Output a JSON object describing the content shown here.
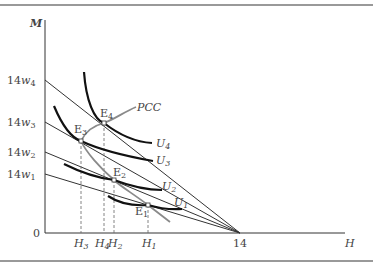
{
  "diagram": {
    "axes": {
      "y_label": "M",
      "x_label": "H",
      "origin_label": "0",
      "x_intercept_label": "14",
      "y_ticks": [
        {
          "prefix": "14",
          "var": "w",
          "sub": "4"
        },
        {
          "prefix": "14",
          "var": "w",
          "sub": "3"
        },
        {
          "prefix": "14",
          "var": "w",
          "sub": "2"
        },
        {
          "prefix": "14",
          "var": "w",
          "sub": "1"
        }
      ],
      "x_ticks": [
        {
          "var": "H",
          "sub": "3"
        },
        {
          "var": "H",
          "sub": "4"
        },
        {
          "var": "H",
          "sub": "2"
        },
        {
          "var": "H",
          "sub": "1"
        }
      ]
    },
    "curves": [
      {
        "var": "U",
        "sub": "4"
      },
      {
        "var": "U",
        "sub": "3"
      },
      {
        "var": "U",
        "sub": "2"
      },
      {
        "var": "U",
        "sub": "1"
      }
    ],
    "equilibria": [
      {
        "var": "E",
        "sub": "4"
      },
      {
        "var": "E",
        "sub": "3"
      },
      {
        "var": "E",
        "sub": "2"
      },
      {
        "var": "E",
        "sub": "1"
      }
    ],
    "pcc_label": "PCC",
    "colors": {
      "budget_line": "#333333",
      "indifference_curve": "#111111",
      "pcc_curve": "#8a8a8a",
      "frame": "#666666",
      "dashed": "#666666"
    }
  }
}
